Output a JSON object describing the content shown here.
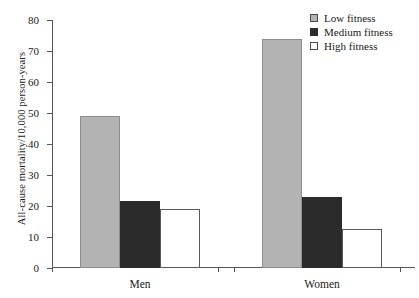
{
  "chart_data": {
    "type": "bar",
    "title": "",
    "xlabel": "",
    "ylabel": "All-cause mortality/10,000 person-years",
    "categories": [
      "Men",
      "Women"
    ],
    "series": [
      {
        "name": "Low fitness",
        "values": [
          49,
          74
        ],
        "color": "#b3b3b3"
      },
      {
        "name": "Medium fitness",
        "values": [
          21.5,
          23
        ],
        "color": "#2b2b2b"
      },
      {
        "name": "High fitness",
        "values": [
          19,
          12.7
        ],
        "color": "#ffffff"
      }
    ],
    "ylim": [
      0,
      80
    ],
    "yticks": [
      0,
      10,
      20,
      30,
      40,
      50,
      60,
      70,
      80
    ],
    "ytick_labels": [
      "0",
      "10",
      "20",
      "30",
      "40",
      "50",
      "60",
      "70",
      "80"
    ],
    "grid": false,
    "legend_position": "top-right"
  },
  "legend": {
    "items": [
      {
        "label": "Low fitness"
      },
      {
        "label": "Medium fitness"
      },
      {
        "label": "High fitness"
      }
    ]
  }
}
